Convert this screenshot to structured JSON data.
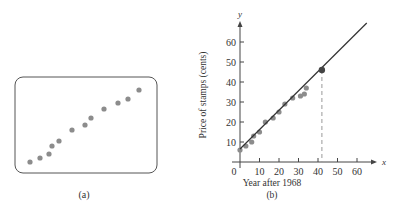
{
  "panel_a": {
    "label": "(a)",
    "frame": {
      "x": 15,
      "y": 77,
      "width": 142,
      "height": 96,
      "radius": 8
    },
    "points_px": [
      [
        30,
        162
      ],
      [
        40,
        158
      ],
      [
        49,
        154
      ],
      [
        52,
        146
      ],
      [
        59,
        141
      ],
      [
        72,
        130
      ],
      [
        85,
        125
      ],
      [
        91,
        118
      ],
      [
        104,
        109
      ],
      [
        118,
        103
      ],
      [
        128,
        99
      ],
      [
        139,
        90
      ]
    ],
    "point_color": "#8c8c8c"
  },
  "panel_b": {
    "label": "(b)",
    "xlabel": "Year after 1968",
    "ylabel": "Price of stamps (cents)",
    "x_axis_letter": "x",
    "y_axis_letter": "y",
    "x_ticks": [
      "0",
      "10",
      "20",
      "30",
      "40",
      "50",
      "60"
    ],
    "y_ticks": [
      "10",
      "20",
      "30",
      "40",
      "50",
      "60"
    ],
    "point_color": "#8c8c8c",
    "line_color": "#333333",
    "highlight_color": "#444444",
    "dashed_color": "#9a9a9a"
  },
  "chart_data": {
    "type": "scatter",
    "title": "",
    "xlabel": "Year after 1968",
    "ylabel": "Price of stamps (cents)",
    "xlim": [
      0,
      65
    ],
    "ylim": [
      0,
      70
    ],
    "x_ticks": [
      0,
      10,
      20,
      30,
      40,
      50,
      60
    ],
    "y_ticks": [
      10,
      20,
      30,
      40,
      50,
      60
    ],
    "grid": false,
    "series": [
      {
        "name": "Stamp prices",
        "x": [
          0,
          3,
          6,
          7,
          10,
          13,
          17,
          20,
          23,
          27,
          31,
          33,
          34
        ],
        "y": [
          6,
          8,
          10,
          13,
          15,
          20,
          22,
          25,
          29,
          32,
          33,
          34,
          37
        ]
      },
      {
        "name": "Fitted line",
        "kind": "line",
        "x": [
          0,
          65
        ],
        "y": [
          6.5,
          69.5
        ]
      },
      {
        "name": "Predicted point",
        "kind": "highlight",
        "x": [
          42
        ],
        "y": [
          46
        ]
      }
    ],
    "annotations": [
      "dashed vertical line from predicted point at x=42 down to x-axis"
    ],
    "panel_label": "(b)"
  }
}
